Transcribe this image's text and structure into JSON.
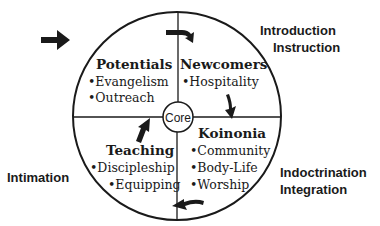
{
  "diagram": {
    "center_label": "Core",
    "quadrants": [
      {
        "title": "Potentials",
        "items": [
          "•Evangelism",
          "•Outreach"
        ]
      },
      {
        "title": "Newcomers",
        "items": [
          "•Hospitality"
        ]
      },
      {
        "title": "Koinonia",
        "items": [
          "•Community",
          "•Body-Life",
          "•Worship"
        ]
      },
      {
        "title": "Teaching",
        "items": [
          "•Discipleship",
          "•Equipping"
        ]
      }
    ],
    "outer_labels": {
      "top_right": [
        "Introduction",
        "Instruction"
      ],
      "bottom_right": [
        "Indoctrination",
        "Integration"
      ],
      "left": "Intimation"
    },
    "colors": {
      "ink": "#1a1a1a",
      "background": "#ffffff"
    }
  }
}
